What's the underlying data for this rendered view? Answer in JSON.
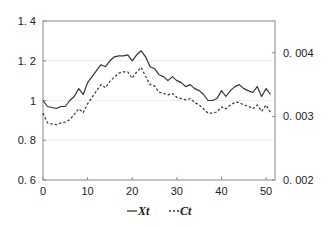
{
  "chart_data": {
    "type": "line",
    "title": "",
    "xlabel": "",
    "ylabel": "",
    "y2label": "",
    "xlim": [
      0,
      52
    ],
    "ylim": [
      0.6,
      1.4
    ],
    "y2lim": [
      0.002,
      0.0045
    ],
    "grid": true,
    "x_ticks": [
      0,
      10,
      20,
      30,
      40,
      50
    ],
    "x_tick_labels": [
      "0",
      "10",
      "20",
      "30",
      "40",
      "50"
    ],
    "y_ticks": [
      0.6,
      0.8,
      1.0,
      1.2,
      1.4
    ],
    "y_tick_labels": [
      "0. 6",
      "0. 8",
      "1",
      "1. 2",
      "1. 4"
    ],
    "y2_ticks": [
      0.002,
      0.003,
      0.004
    ],
    "y2_tick_labels": [
      "0. 002",
      "0. 003",
      "0. 004"
    ],
    "legend_position": "bottom",
    "x": [
      0,
      1,
      2,
      3,
      4,
      5,
      6,
      7,
      8,
      9,
      10,
      11,
      12,
      13,
      14,
      15,
      16,
      17,
      18,
      19,
      20,
      21,
      22,
      23,
      24,
      25,
      26,
      27,
      28,
      29,
      30,
      31,
      32,
      33,
      34,
      35,
      36,
      37,
      38,
      39,
      40,
      41,
      42,
      43,
      44,
      45,
      46,
      47,
      48,
      49,
      50,
      51
    ],
    "series": [
      {
        "name": "Xt",
        "axis": "left",
        "style": "solid",
        "values": [
          1.0,
          0.97,
          0.965,
          0.96,
          0.97,
          0.97,
          1.0,
          1.02,
          1.06,
          1.03,
          1.09,
          1.12,
          1.15,
          1.18,
          1.17,
          1.2,
          1.22,
          1.225,
          1.225,
          1.23,
          1.2,
          1.23,
          1.25,
          1.22,
          1.17,
          1.16,
          1.13,
          1.12,
          1.1,
          1.12,
          1.1,
          1.09,
          1.07,
          1.08,
          1.06,
          1.05,
          1.03,
          1.0,
          1.0,
          1.01,
          1.05,
          1.02,
          1.05,
          1.07,
          1.08,
          1.06,
          1.05,
          1.04,
          1.07,
          1.02,
          1.06,
          1.03
        ]
      },
      {
        "name": "Ct",
        "axis": "right",
        "style": "dashed",
        "values": [
          0.00305,
          0.0029,
          0.00288,
          0.00287,
          0.0029,
          0.00291,
          0.00295,
          0.00303,
          0.00312,
          0.00306,
          0.0032,
          0.0033,
          0.0034,
          0.0035,
          0.00345,
          0.00355,
          0.00362,
          0.00368,
          0.0037,
          0.0037,
          0.0036,
          0.0037,
          0.00377,
          0.00363,
          0.0035,
          0.00348,
          0.00338,
          0.00336,
          0.00334,
          0.00336,
          0.0033,
          0.00328,
          0.00326,
          0.00328,
          0.00322,
          0.00318,
          0.00312,
          0.00305,
          0.00305,
          0.00307,
          0.00315,
          0.00312,
          0.00318,
          0.00322,
          0.00322,
          0.00318,
          0.00316,
          0.00312,
          0.00318,
          0.00308,
          0.00318,
          0.00306
        ]
      }
    ]
  }
}
